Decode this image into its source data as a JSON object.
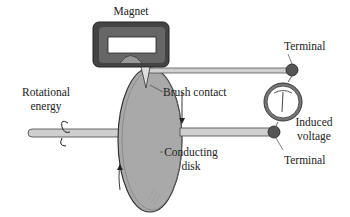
{
  "diagram": {
    "labels": {
      "magnet": "Magnet",
      "terminal_top": "Terminal",
      "brush_contact": "Brush contact",
      "rotational_energy_line1": "Rotational",
      "rotational_energy_line2": "energy",
      "induced_voltage_line1": "Induced",
      "induced_voltage_line2": "voltage",
      "conducting_disk_line1": "Conducting",
      "conducting_disk_line2": "disk",
      "terminal_bottom": "Terminal"
    },
    "colors": {
      "magnet": "#555555",
      "disk": "#a9a9a9",
      "rod": "#c8c8c8",
      "terminal": "#5a5a5a",
      "line": "#333333"
    }
  }
}
